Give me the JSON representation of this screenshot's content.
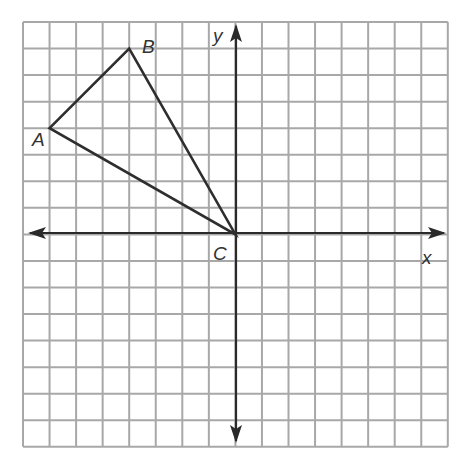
{
  "diagram": {
    "type": "coordinate-grid",
    "grid": {
      "columns": 16,
      "rows": 16,
      "x_min": -8,
      "x_max": 8,
      "y_min": -8,
      "y_max": 8,
      "line_color": "#a8a8a8"
    },
    "axes": {
      "x_label": "x",
      "y_label": "y",
      "color": "#2a2a2a"
    },
    "triangle": {
      "color": "#2e2e2e",
      "vertices": [
        {
          "label": "A",
          "x": -7,
          "y": 4
        },
        {
          "label": "B",
          "x": -4,
          "y": 7
        },
        {
          "label": "C",
          "x": 0,
          "y": 0
        }
      ]
    }
  }
}
